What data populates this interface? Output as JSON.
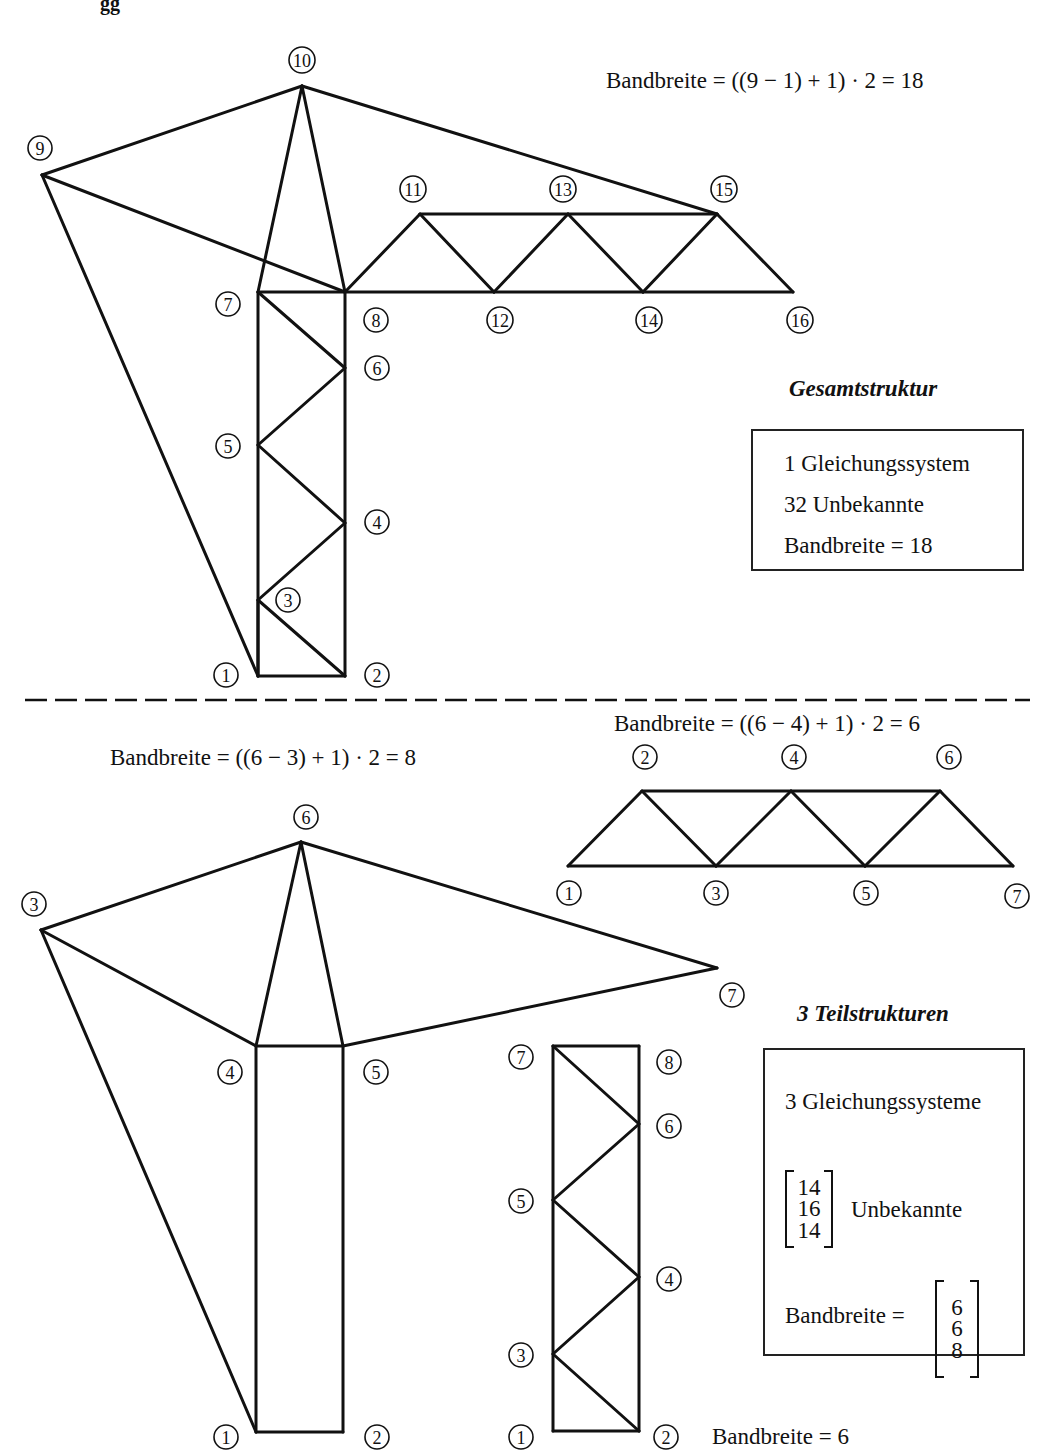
{
  "page_header_fragment": "gg",
  "top": {
    "formula": "Bandbreite = ((9 − 1) + 1) · 2 = 18",
    "heading": "Gesamtstruktur",
    "box_lines": [
      "1 Gleichungssystem",
      "32 Unbekannte",
      "Bandbreite = 18"
    ],
    "structure": {
      "nodes": [
        {
          "id": "1",
          "x": 258,
          "y": 676,
          "lx": 226,
          "ly": 675
        },
        {
          "id": "2",
          "x": 345,
          "y": 676,
          "lx": 377,
          "ly": 675
        },
        {
          "id": "3",
          "x": 258,
          "y": 600,
          "lx": 288,
          "ly": 600
        },
        {
          "id": "4",
          "x": 345,
          "y": 523,
          "lx": 377,
          "ly": 522
        },
        {
          "id": "5",
          "x": 258,
          "y": 445,
          "lx": 228,
          "ly": 446
        },
        {
          "id": "6",
          "x": 345,
          "y": 368,
          "lx": 377,
          "ly": 368
        },
        {
          "id": "7",
          "x": 258,
          "y": 292,
          "lx": 228,
          "ly": 304
        },
        {
          "id": "8",
          "x": 345,
          "y": 292,
          "lx": 376,
          "ly": 320
        },
        {
          "id": "9",
          "x": 42,
          "y": 175,
          "lx": 40,
          "ly": 148
        },
        {
          "id": "10",
          "x": 302,
          "y": 86,
          "lx": 302,
          "ly": 60
        },
        {
          "id": "11",
          "x": 420,
          "y": 214,
          "lx": 413,
          "ly": 189
        },
        {
          "id": "12",
          "x": 494,
          "y": 292,
          "lx": 500,
          "ly": 320
        },
        {
          "id": "13",
          "x": 568,
          "y": 214,
          "lx": 563,
          "ly": 189
        },
        {
          "id": "14",
          "x": 643,
          "y": 292,
          "lx": 649,
          "ly": 320
        },
        {
          "id": "15",
          "x": 717,
          "y": 214,
          "lx": 724,
          "ly": 189
        },
        {
          "id": "16",
          "x": 793,
          "y": 292,
          "lx": 800,
          "ly": 320
        }
      ],
      "members": [
        [
          "1",
          "2"
        ],
        [
          "1",
          "7"
        ],
        [
          "2",
          "8"
        ],
        [
          "1",
          "3"
        ],
        [
          "3",
          "2"
        ],
        [
          "3",
          "4"
        ],
        [
          "4",
          "5"
        ],
        [
          "5",
          "6"
        ],
        [
          "6",
          "7"
        ],
        [
          "7",
          "8"
        ],
        [
          "9",
          "1"
        ],
        [
          "9",
          "10"
        ],
        [
          "9",
          "8"
        ],
        [
          "10",
          "7"
        ],
        [
          "10",
          "8"
        ],
        [
          "10",
          "15"
        ],
        [
          "8",
          "11"
        ],
        [
          "11",
          "12"
        ],
        [
          "12",
          "13"
        ],
        [
          "13",
          "14"
        ],
        [
          "14",
          "15"
        ],
        [
          "15",
          "16"
        ],
        [
          "11",
          "13"
        ],
        [
          "13",
          "15"
        ],
        [
          "8",
          "12"
        ],
        [
          "12",
          "14"
        ],
        [
          "14",
          "16"
        ]
      ]
    }
  },
  "bottom": {
    "formula_left": "Bandbreite = ((6 − 3) + 1) · 2 = 8",
    "formula_right": "Bandbreite = ((6 − 4) + 1) · 2 = 6",
    "formula_tower": "Bandbreite = 6",
    "heading": "3 Teilstrukturen",
    "box_line_1": "3 Gleichungssysteme",
    "unknowns": [
      "14",
      "16",
      "14"
    ],
    "unknowns_label": "Unbekannte",
    "bandwidth_label": "Bandbreite =",
    "bandwidths": [
      "6",
      "6",
      "8"
    ],
    "substructures": [
      {
        "name": "head",
        "nodes": [
          {
            "id": "1",
            "x": 256,
            "y": 1432,
            "lx": 226,
            "ly": 1437
          },
          {
            "id": "2",
            "x": 343,
            "y": 1432,
            "lx": 377,
            "ly": 1437
          },
          {
            "id": "3",
            "x": 41,
            "y": 930,
            "lx": 34,
            "ly": 904
          },
          {
            "id": "4",
            "x": 256,
            "y": 1046,
            "lx": 230,
            "ly": 1072
          },
          {
            "id": "5",
            "x": 343,
            "y": 1046,
            "lx": 376,
            "ly": 1072
          },
          {
            "id": "6",
            "x": 301,
            "y": 842,
            "lx": 306,
            "ly": 817
          },
          {
            "id": "7",
            "x": 717,
            "y": 968,
            "lx": 732,
            "ly": 995
          }
        ],
        "members": [
          [
            "1",
            "2"
          ],
          [
            "1",
            "4"
          ],
          [
            "2",
            "5"
          ],
          [
            "4",
            "5"
          ],
          [
            "3",
            "1"
          ],
          [
            "3",
            "6"
          ],
          [
            "3",
            "4"
          ],
          [
            "6",
            "4"
          ],
          [
            "6",
            "5"
          ],
          [
            "6",
            "7"
          ],
          [
            "5",
            "7"
          ]
        ]
      },
      {
        "name": "jib",
        "nodes": [
          {
            "id": "1",
            "x": 568,
            "y": 866,
            "lx": 569,
            "ly": 893
          },
          {
            "id": "2",
            "x": 642,
            "y": 791,
            "lx": 645,
            "ly": 757
          },
          {
            "id": "3",
            "x": 716,
            "y": 866,
            "lx": 716,
            "ly": 893
          },
          {
            "id": "4",
            "x": 791,
            "y": 791,
            "lx": 794,
            "ly": 757
          },
          {
            "id": "5",
            "x": 865,
            "y": 866,
            "lx": 866,
            "ly": 893
          },
          {
            "id": "6",
            "x": 940,
            "y": 791,
            "lx": 949,
            "ly": 757
          },
          {
            "id": "7",
            "x": 1013,
            "y": 866,
            "lx": 1017,
            "ly": 896
          }
        ],
        "members": [
          [
            "1",
            "3"
          ],
          [
            "3",
            "5"
          ],
          [
            "5",
            "7"
          ],
          [
            "2",
            "4"
          ],
          [
            "4",
            "6"
          ],
          [
            "1",
            "2"
          ],
          [
            "2",
            "3"
          ],
          [
            "3",
            "4"
          ],
          [
            "4",
            "5"
          ],
          [
            "5",
            "6"
          ],
          [
            "6",
            "7"
          ]
        ]
      },
      {
        "name": "tower",
        "nodes": [
          {
            "id": "1",
            "x": 553,
            "y": 1431,
            "lx": 521,
            "ly": 1437
          },
          {
            "id": "2",
            "x": 639,
            "y": 1431,
            "lx": 666,
            "ly": 1437
          },
          {
            "id": "3",
            "x": 553,
            "y": 1354,
            "lx": 521,
            "ly": 1355
          },
          {
            "id": "4",
            "x": 639,
            "y": 1277,
            "lx": 669,
            "ly": 1279
          },
          {
            "id": "5",
            "x": 553,
            "y": 1200,
            "lx": 521,
            "ly": 1201
          },
          {
            "id": "6",
            "x": 639,
            "y": 1124,
            "lx": 669,
            "ly": 1126
          },
          {
            "id": "7",
            "x": 553,
            "y": 1046,
            "lx": 521,
            "ly": 1057
          },
          {
            "id": "8",
            "x": 639,
            "y": 1046,
            "lx": 669,
            "ly": 1062
          }
        ],
        "members": [
          [
            "1",
            "2"
          ],
          [
            "1",
            "7"
          ],
          [
            "2",
            "8"
          ],
          [
            "7",
            "8"
          ],
          [
            "7",
            "6"
          ],
          [
            "6",
            "5"
          ],
          [
            "5",
            "4"
          ],
          [
            "4",
            "3"
          ],
          [
            "3",
            "2"
          ]
        ]
      }
    ]
  }
}
